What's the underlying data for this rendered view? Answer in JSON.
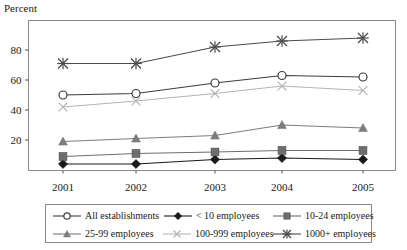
{
  "chart_data": {
    "type": "line",
    "title": "",
    "xlabel": "",
    "ylabel": "Percent",
    "categories": [
      "2001",
      "2002",
      "2003",
      "2004",
      "2005"
    ],
    "ylim": [
      0,
      95
    ],
    "yticks": [
      20,
      40,
      60,
      80
    ],
    "ytick_labels": [
      "20",
      "40",
      "60",
      "80"
    ],
    "grid": false,
    "legend_position": "bottom",
    "series": [
      {
        "name": "All establishments",
        "marker": "open-circle",
        "color": "#3c3c3c",
        "values": [
          50,
          51,
          58,
          63,
          62
        ]
      },
      {
        "name": "< 10 employees",
        "marker": "filled-diamond",
        "color": "#1a1a1a",
        "values": [
          4,
          4,
          7,
          8,
          7
        ]
      },
      {
        "name": "10-24 employees",
        "marker": "filled-square",
        "color": "#6e6e6e",
        "values": [
          9,
          11,
          12,
          13,
          13
        ]
      },
      {
        "name": "25-99 employees",
        "marker": "filled-triangle",
        "color": "#7d7d7d",
        "values": [
          19,
          21,
          23,
          30,
          28
        ]
      },
      {
        "name": "100-999 employees",
        "marker": "x-cross",
        "color": "#b4b4b4",
        "values": [
          42,
          46,
          51,
          56,
          53
        ]
      },
      {
        "name": "1000+ employees",
        "marker": "asterisk-star",
        "color": "#4a4a4a",
        "values": [
          71,
          71,
          82,
          86,
          88
        ]
      }
    ]
  },
  "axis": {
    "y_title": "Percent",
    "y_tick_0": "20",
    "y_tick_1": "40",
    "y_tick_2": "60",
    "y_tick_3": "80",
    "x_tick_0": "2001",
    "x_tick_1": "2002",
    "x_tick_2": "2003",
    "x_tick_3": "2004",
    "x_tick_4": "2005"
  },
  "legend": {
    "rows": [
      [
        {
          "label": "All establishments",
          "marker": "open-circle",
          "color": "#3c3c3c"
        },
        {
          "label": "< 10 employees",
          "marker": "filled-diamond",
          "color": "#1a1a1a"
        },
        {
          "label": "10-24 employees",
          "marker": "filled-square",
          "color": "#6e6e6e"
        }
      ],
      [
        {
          "label": "25-99 employees",
          "marker": "filled-triangle",
          "color": "#7d7d7d"
        },
        {
          "label": "100-999 employees",
          "marker": "x-cross",
          "color": "#b4b4b4"
        },
        {
          "label": "1000+ employees",
          "marker": "asterisk-star",
          "color": "#4a4a4a"
        }
      ]
    ]
  },
  "style": {
    "plot_border_color": "#8a8a8a",
    "axis_color": "#555555",
    "background": "#ffffff"
  }
}
